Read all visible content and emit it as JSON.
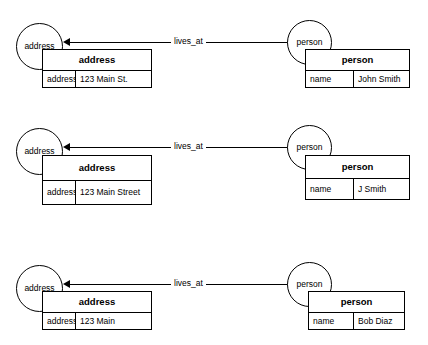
{
  "diagram": {
    "colors": {
      "stroke": "#000000",
      "background": "#ffffff",
      "text": "#000000"
    },
    "blocks": [
      {
        "id": "instance-1",
        "source_node": "address",
        "target_node": "person",
        "edge_label": "lives_at",
        "address_table": {
          "header": "address",
          "key": "address",
          "value": "123 Main St."
        },
        "person_table": {
          "header": "person",
          "key": "name",
          "value": "John Smith"
        }
      },
      {
        "id": "instance-2",
        "source_node": "address",
        "target_node": "person",
        "edge_label": "lives_at",
        "address_table": {
          "header": "address",
          "key": "address",
          "value": "123 Main Street"
        },
        "person_table": {
          "header": "person",
          "key": "name",
          "value": "J Smith"
        }
      },
      {
        "id": "instance-3",
        "source_node": "address",
        "target_node": "person",
        "edge_label": "lives_at",
        "address_table": {
          "header": "address",
          "key": "address",
          "value": "123 Main"
        },
        "person_table": {
          "header": "person",
          "key": "name",
          "value": "Bob Diaz"
        }
      }
    ]
  }
}
